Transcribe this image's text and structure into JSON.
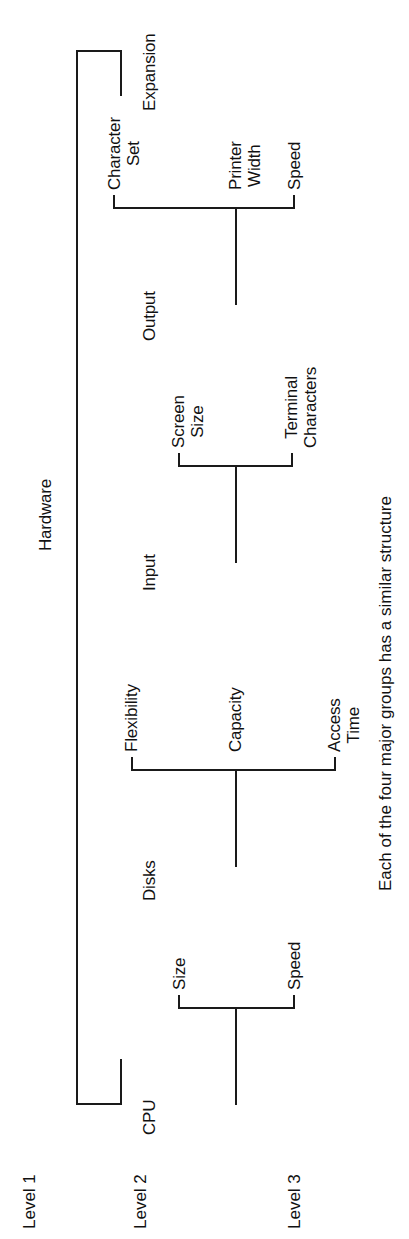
{
  "figure": {
    "orientation": "rotated-90-ccw",
    "caption": "Each of the four major groups has a similar structure",
    "ink_color": "#1a1a1a",
    "background_color": "#ffffff"
  },
  "level_labels": [
    {
      "id": "level-1",
      "text": "Level 1"
    },
    {
      "id": "level-2",
      "text": "Level 2"
    },
    {
      "id": "level-3",
      "text": "Level 3"
    }
  ],
  "tree": {
    "root": {
      "id": "hardware",
      "label": "Hardware",
      "level": 1
    },
    "branches": [
      {
        "id": "cpu",
        "label": "CPU",
        "level": 2,
        "children": [
          {
            "id": "cpu-speed",
            "label": "Speed"
          },
          {
            "id": "cpu-size",
            "label": "Size"
          }
        ]
      },
      {
        "id": "disks",
        "label": "Disks",
        "level": 2,
        "children": [
          {
            "id": "disks-access-time",
            "label": "Access\nTime"
          },
          {
            "id": "disks-capacity",
            "label": "Capacity"
          },
          {
            "id": "disks-flexibility",
            "label": "Flexibility"
          }
        ]
      },
      {
        "id": "input",
        "label": "Input",
        "level": 2,
        "children": [
          {
            "id": "input-terminal-characters",
            "label": "Terminal\nCharacters"
          },
          {
            "id": "input-screen-size",
            "label": "Screen\nSize"
          }
        ]
      },
      {
        "id": "output",
        "label": "Output",
        "level": 2,
        "children": [
          {
            "id": "output-speed",
            "label": "Speed"
          },
          {
            "id": "output-printer-width",
            "label": "Printer\nWidth"
          },
          {
            "id": "output-character-set",
            "label": "Character\nSet"
          }
        ]
      },
      {
        "id": "expansion",
        "label": "Expansion",
        "level": 2,
        "children": []
      }
    ]
  }
}
